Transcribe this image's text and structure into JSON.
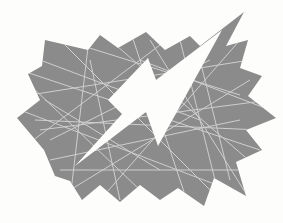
{
  "image": {
    "description": "Clip-art starburst with a lightning bolt cutout",
    "subject": "lightning-bolt-starburst",
    "colors": {
      "background": "#fdfdfb",
      "burst_fill": "#8b8b8b",
      "scratch_lines": "#d6d6d6",
      "bolt_fill": "#fdfdfb"
    }
  }
}
